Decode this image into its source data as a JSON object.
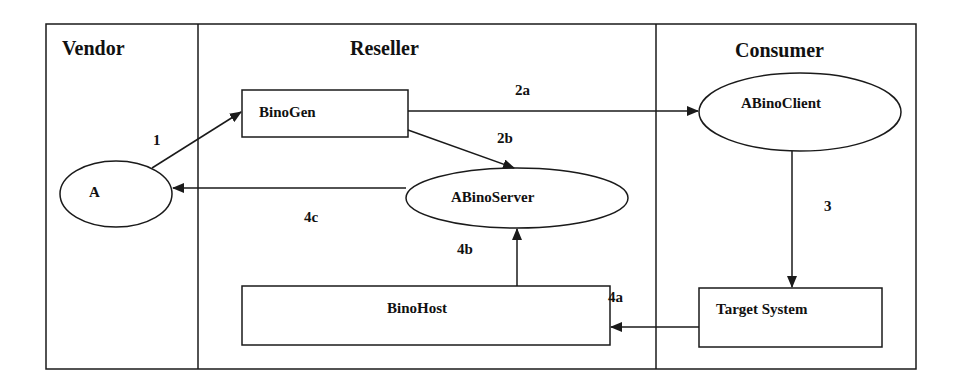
{
  "diagram": {
    "colors": {
      "stroke": "#1a1a1a",
      "text": "#111111",
      "background": "#ffffff"
    },
    "swimlanes": [
      {
        "id": "vendor",
        "label": "Vendor"
      },
      {
        "id": "reseller",
        "label": "Reseller"
      },
      {
        "id": "consumer",
        "label": "Consumer"
      }
    ],
    "nodes": {
      "a": {
        "label": "A",
        "shape": "ellipse",
        "lane": "vendor"
      },
      "binogen": {
        "label": "BinoGen",
        "shape": "rectangle",
        "lane": "reseller"
      },
      "abinoserver": {
        "label": "ABinoServer",
        "shape": "ellipse",
        "lane": "reseller"
      },
      "binohost": {
        "label": "BinoHost",
        "shape": "rectangle",
        "lane": "reseller"
      },
      "abinoclient": {
        "label": "ABinoClient",
        "shape": "ellipse",
        "lane": "consumer"
      },
      "target_system": {
        "label": "Target System",
        "shape": "rectangle",
        "lane": "consumer"
      }
    },
    "edges": [
      {
        "id": "e1",
        "label": "1",
        "from": "A",
        "to": "BinoGen"
      },
      {
        "id": "e2a",
        "label": "2a",
        "from": "BinoGen",
        "to": "ABinoClient"
      },
      {
        "id": "e2b",
        "label": "2b",
        "from": "BinoGen",
        "to": "ABinoServer"
      },
      {
        "id": "e3",
        "label": "3",
        "from": "ABinoClient",
        "to": "Target System"
      },
      {
        "id": "e4a",
        "label": "4a",
        "from": "Target System",
        "to": "BinoHost"
      },
      {
        "id": "e4b",
        "label": "4b",
        "from": "BinoHost",
        "to": "ABinoServer"
      },
      {
        "id": "e4c",
        "label": "4c",
        "from": "ABinoServer",
        "to": "A"
      }
    ]
  }
}
